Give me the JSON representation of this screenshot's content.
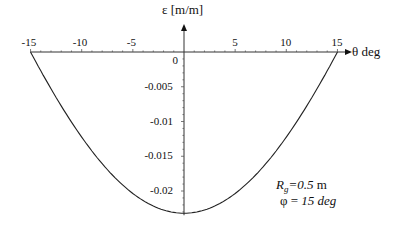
{
  "chart_data": {
    "type": "line",
    "title": "",
    "xlabel": "θ deg",
    "ylabel": "ε [m/m]",
    "xlim": [
      -15,
      15
    ],
    "ylim": [
      -0.0232,
      0
    ],
    "x_ticks": [
      "-15",
      "-10",
      "-5",
      "5",
      "10",
      "15"
    ],
    "y_ticks": [
      "0",
      "-0.005",
      "-0.01",
      "-0.015",
      "-0.02"
    ],
    "grid": false,
    "legend": null,
    "series": [
      {
        "name": "strain",
        "x": [
          -15,
          -12,
          -9,
          -6,
          -3,
          0,
          3,
          6,
          9,
          12,
          15
        ],
        "y": [
          0,
          -0.0083,
          -0.0148,
          -0.0195,
          -0.0223,
          -0.0232,
          -0.0223,
          -0.0195,
          -0.0148,
          -0.0083,
          0
        ]
      }
    ],
    "annotations": [
      {
        "text": "Rg=0.5 m"
      },
      {
        "text": "φ = 15 deg"
      }
    ]
  },
  "labels": {
    "ylabel": "ε [m/m]",
    "xlabel": "θ deg",
    "rg_main": "R",
    "rg_sub": "g",
    "rg_val": "=0.5",
    "rg_unit": " m",
    "phi_sym": "φ = ",
    "phi_val": "15 deg"
  }
}
